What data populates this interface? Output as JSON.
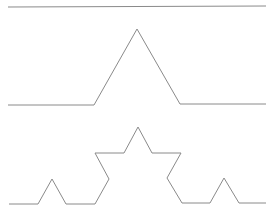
{
  "diagram": {
    "stroke_color": "#8a8a8a",
    "background": "#ffffff",
    "iterations": [
      {
        "name": "iteration-0",
        "points": "8,7 266,6"
      },
      {
        "name": "iteration-1",
        "points": "8,105 94,105 137,29 180,104 266,104"
      },
      {
        "name": "iteration-2",
        "points": "9,204 38,204 52,179 66,204 95,204 109,179 95,153 124,153 138,127 152,153 181,153 167,178 182,203 210,203 224,178 239,203 266,203"
      }
    ]
  }
}
